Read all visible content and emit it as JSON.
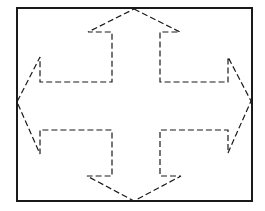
{
  "figure": {
    "colors": {
      "stroke": "#1a1a1a",
      "background": "#ffffff"
    },
    "frame": {
      "x": 17,
      "y": 8,
      "width": 235,
      "height": 193,
      "stroke_width": 2
    },
    "arrow_outline": {
      "style": "dashed",
      "dash": "6,3",
      "stroke_width": 1.2,
      "points": [
        [
          134,
          9
        ],
        [
          180,
          32
        ],
        [
          160,
          32
        ],
        [
          160,
          82
        ],
        [
          228,
          82
        ],
        [
          228,
          57
        ],
        [
          251,
          101
        ],
        [
          228,
          153
        ],
        [
          228,
          130
        ],
        [
          160,
          130
        ],
        [
          160,
          176
        ],
        [
          181,
          176
        ],
        [
          134,
          201
        ],
        [
          87,
          176
        ],
        [
          112,
          176
        ],
        [
          112,
          130
        ],
        [
          40,
          130
        ],
        [
          40,
          154
        ],
        [
          17,
          102
        ],
        [
          40,
          57
        ],
        [
          40,
          82
        ],
        [
          112,
          82
        ],
        [
          112,
          32
        ],
        [
          88,
          32
        ]
      ]
    }
  }
}
